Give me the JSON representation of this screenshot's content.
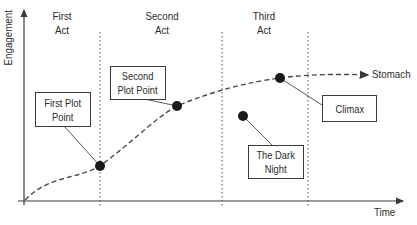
{
  "diagram": {
    "title": "",
    "axes": {
      "y_label": "Engagement",
      "x_label": "Time"
    },
    "acts": [
      {
        "label_line1": "First",
        "label_line2": "Act"
      },
      {
        "label_line1": "Second",
        "label_line2": "Act"
      },
      {
        "label_line1": "Third",
        "label_line2": "Act"
      }
    ],
    "end_label": "Stomach",
    "callouts": [
      {
        "line1": "First Plot",
        "line2": "Point"
      },
      {
        "line1": "Second",
        "line2": "Plot Point"
      },
      {
        "line1": "Climax",
        "line2": ""
      },
      {
        "line1": "The Dark",
        "line2": "Night"
      }
    ],
    "colors": {
      "ink": "#2b2b2b",
      "point": "#1a1a1a",
      "background": "#ffffff"
    }
  }
}
